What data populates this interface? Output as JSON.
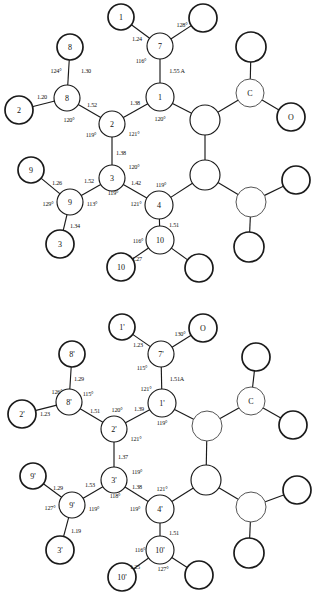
{
  "figure": {
    "title": "",
    "type": "chemical-structure-diagram",
    "panels": [
      {
        "id": "top",
        "name": "molecule-a",
        "atoms": [
          {
            "id": "n1",
            "label": "1",
            "cx": 160,
            "cy": 97,
            "r": 14,
            "style": "plain"
          },
          {
            "id": "n2",
            "label": "2",
            "cx": 112,
            "cy": 124,
            "r": 13,
            "style": "plain"
          },
          {
            "id": "n3",
            "label": "3",
            "cx": 112,
            "cy": 178,
            "r": 13,
            "style": "plain"
          },
          {
            "id": "n4",
            "label": "4",
            "cx": 159,
            "cy": 205,
            "r": 14,
            "style": "plain"
          },
          {
            "id": "n7",
            "label": "7",
            "cx": 160,
            "cy": 46,
            "r": 13,
            "style": "plain"
          },
          {
            "id": "n8",
            "label": "8",
            "cx": 67,
            "cy": 98,
            "r": 13,
            "style": "plain"
          },
          {
            "id": "n9",
            "label": "9",
            "cx": 70,
            "cy": 202,
            "r": 13,
            "style": "plain"
          },
          {
            "id": "n10",
            "label": "10",
            "cx": 160,
            "cy": 240,
            "r": 14,
            "style": "plain"
          },
          {
            "id": "t1",
            "label": "1",
            "cx": 121,
            "cy": 17,
            "r": 13,
            "style": "thick"
          },
          {
            "id": "t7b",
            "label": "",
            "cx": 203,
            "cy": 18,
            "r": 14,
            "style": "thick"
          },
          {
            "id": "t8",
            "label": "8",
            "cx": 70,
            "cy": 47,
            "r": 13,
            "style": "thick"
          },
          {
            "id": "t2",
            "label": "2",
            "cx": 19,
            "cy": 110,
            "r": 14,
            "style": "thick"
          },
          {
            "id": "t9",
            "label": "9",
            "cx": 31,
            "cy": 170,
            "r": 13,
            "style": "thick"
          },
          {
            "id": "t3",
            "label": "3",
            "cx": 60,
            "cy": 244,
            "r": 14,
            "style": "thick"
          },
          {
            "id": "t10",
            "label": "10",
            "cx": 121,
            "cy": 267,
            "r": 14,
            "style": "thick"
          },
          {
            "id": "t10b",
            "label": "",
            "cx": 199,
            "cy": 268,
            "r": 14,
            "style": "thick"
          },
          {
            "id": "r1",
            "label": "",
            "cx": 205,
            "cy": 120,
            "r": 15,
            "style": "plain"
          },
          {
            "id": "r2",
            "label": "",
            "cx": 205,
            "cy": 175,
            "r": 15,
            "style": "plain"
          },
          {
            "id": "rC",
            "label": "C",
            "cx": 250,
            "cy": 93,
            "r": 14,
            "style": "faint"
          },
          {
            "id": "rO",
            "label": "O",
            "cx": 291,
            "cy": 117,
            "r": 14,
            "style": "thick"
          },
          {
            "id": "rCtop",
            "label": "",
            "cx": 251,
            "cy": 47,
            "r": 15,
            "style": "thick"
          },
          {
            "id": "r3",
            "label": "",
            "cx": 251,
            "cy": 202,
            "r": 15,
            "style": "faint"
          },
          {
            "id": "r3a",
            "label": "",
            "cx": 296,
            "cy": 180,
            "r": 14,
            "style": "thick"
          },
          {
            "id": "r3b",
            "label": "",
            "cx": 249,
            "cy": 247,
            "r": 15,
            "style": "thick"
          }
        ],
        "bonds": [
          {
            "from": "t1",
            "to": "n7"
          },
          {
            "from": "t7b",
            "to": "n7"
          },
          {
            "from": "n7",
            "to": "n1"
          },
          {
            "from": "n1",
            "to": "n2"
          },
          {
            "from": "n1",
            "to": "r1"
          },
          {
            "from": "n2",
            "to": "n8"
          },
          {
            "from": "n2",
            "to": "n3"
          },
          {
            "from": "n8",
            "to": "t8"
          },
          {
            "from": "n8",
            "to": "t2"
          },
          {
            "from": "n3",
            "to": "n9"
          },
          {
            "from": "n3",
            "to": "n4"
          },
          {
            "from": "n9",
            "to": "t9"
          },
          {
            "from": "n9",
            "to": "t3"
          },
          {
            "from": "n4",
            "to": "n10"
          },
          {
            "from": "n4",
            "to": "r2"
          },
          {
            "from": "n10",
            "to": "t10"
          },
          {
            "from": "n10",
            "to": "t10b"
          },
          {
            "from": "r1",
            "to": "r2"
          },
          {
            "from": "r1",
            "to": "rC"
          },
          {
            "from": "rC",
            "to": "rCtop"
          },
          {
            "from": "rC",
            "to": "rO"
          },
          {
            "from": "r2",
            "to": "r3"
          },
          {
            "from": "r3",
            "to": "r3a"
          },
          {
            "from": "r3",
            "to": "r3b"
          }
        ],
        "annotations": [
          {
            "text": "128°",
            "x": 182,
            "y": 24,
            "kind": "angle"
          },
          {
            "text": "1.24",
            "x": 137,
            "y": 38,
            "kind": "length"
          },
          {
            "text": "116°",
            "x": 141,
            "y": 60,
            "kind": "angle"
          },
          {
            "text": "1.55 A",
            "x": 177,
            "y": 70,
            "kind": "length"
          },
          {
            "text": "1.30",
            "x": 86,
            "y": 70,
            "kind": "length"
          },
          {
            "text": "124°",
            "x": 56,
            "y": 70,
            "kind": "angle"
          },
          {
            "text": "1.20",
            "x": 42,
            "y": 96,
            "kind": "length"
          },
          {
            "text": "120°",
            "x": 69,
            "y": 119,
            "kind": "angle"
          },
          {
            "text": "1.52",
            "x": 92,
            "y": 104,
            "kind": "length"
          },
          {
            "text": "1.38",
            "x": 135,
            "y": 102,
            "kind": "length"
          },
          {
            "text": "120°",
            "x": 160,
            "y": 118,
            "kind": "angle"
          },
          {
            "text": "119°",
            "x": 91,
            "y": 134,
            "kind": "angle"
          },
          {
            "text": "121°",
            "x": 134,
            "y": 133,
            "kind": "angle"
          },
          {
            "text": "1.38",
            "x": 121,
            "y": 152,
            "kind": "length"
          },
          {
            "text": "120°",
            "x": 134,
            "y": 166,
            "kind": "angle"
          },
          {
            "text": "1.26",
            "x": 57,
            "y": 182,
            "kind": "length"
          },
          {
            "text": "1.52",
            "x": 89,
            "y": 180,
            "kind": "length"
          },
          {
            "text": "129°",
            "x": 48,
            "y": 203,
            "kind": "angle"
          },
          {
            "text": "113°",
            "x": 92,
            "y": 203,
            "kind": "angle"
          },
          {
            "text": "119°",
            "x": 113,
            "y": 192,
            "kind": "angle"
          },
          {
            "text": "1.42",
            "x": 136,
            "y": 182,
            "kind": "length"
          },
          {
            "text": "119°",
            "x": 161,
            "y": 184,
            "kind": "angle"
          },
          {
            "text": "121°",
            "x": 136,
            "y": 203,
            "kind": "angle"
          },
          {
            "text": "1.34",
            "x": 75,
            "y": 225,
            "kind": "length"
          },
          {
            "text": "1.51",
            "x": 174,
            "y": 224,
            "kind": "length"
          },
          {
            "text": "116°",
            "x": 138,
            "y": 240,
            "kind": "angle"
          },
          {
            "text": "1.27",
            "x": 137,
            "y": 258,
            "kind": "length"
          }
        ]
      },
      {
        "id": "bottom",
        "name": "molecule-b",
        "atoms": [
          {
            "id": "n1",
            "label": "1'",
            "cx": 162,
            "cy": 105,
            "r": 14,
            "style": "plain"
          },
          {
            "id": "n2",
            "label": "2'",
            "cx": 114,
            "cy": 131,
            "r": 13,
            "style": "plain"
          },
          {
            "id": "n3",
            "label": "3'",
            "cx": 114,
            "cy": 182,
            "r": 13,
            "style": "plain"
          },
          {
            "id": "n4",
            "label": "4'",
            "cx": 160,
            "cy": 211,
            "r": 14,
            "style": "plain"
          },
          {
            "id": "n7",
            "label": "7'",
            "cx": 161,
            "cy": 56,
            "r": 13,
            "style": "plain"
          },
          {
            "id": "n8",
            "label": "8'",
            "cx": 69,
            "cy": 104,
            "r": 13,
            "style": "plain"
          },
          {
            "id": "n9",
            "label": "9'",
            "cx": 72,
            "cy": 207,
            "r": 13,
            "style": "plain"
          },
          {
            "id": "n10",
            "label": "10'",
            "cx": 160,
            "cy": 252,
            "r": 14,
            "style": "plain"
          },
          {
            "id": "t1",
            "label": "1'",
            "cx": 122,
            "cy": 29,
            "r": 13,
            "style": "thick"
          },
          {
            "id": "tO",
            "label": "O",
            "cx": 203,
            "cy": 30,
            "r": 14,
            "style": "thick"
          },
          {
            "id": "t8",
            "label": "8'",
            "cx": 72,
            "cy": 56,
            "r": 13,
            "style": "thick"
          },
          {
            "id": "t2",
            "label": "2'",
            "cx": 22,
            "cy": 116,
            "r": 14,
            "style": "thick"
          },
          {
            "id": "t9",
            "label": "9'",
            "cx": 33,
            "cy": 178,
            "r": 13,
            "style": "thick"
          },
          {
            "id": "t3",
            "label": "3'",
            "cx": 60,
            "cy": 252,
            "r": 14,
            "style": "thick"
          },
          {
            "id": "t10",
            "label": "10'",
            "cx": 122,
            "cy": 279,
            "r": 14,
            "style": "thick"
          },
          {
            "id": "t10b",
            "label": "",
            "cx": 199,
            "cy": 277,
            "r": 14,
            "style": "thick"
          },
          {
            "id": "r1",
            "label": "",
            "cx": 207,
            "cy": 128,
            "r": 15,
            "style": "faint"
          },
          {
            "id": "r2",
            "label": "",
            "cx": 206,
            "cy": 182,
            "r": 15,
            "style": "plain"
          },
          {
            "id": "rC",
            "label": "C",
            "cx": 251,
            "cy": 103,
            "r": 14,
            "style": "faint"
          },
          {
            "id": "rCtop",
            "label": "",
            "cx": 256,
            "cy": 59,
            "r": 14,
            "style": "thick"
          },
          {
            "id": "rCright",
            "label": "",
            "cx": 293,
            "cy": 127,
            "r": 14,
            "style": "thick"
          },
          {
            "id": "r3",
            "label": "",
            "cx": 251,
            "cy": 209,
            "r": 15,
            "style": "faint"
          },
          {
            "id": "r3a",
            "label": "",
            "cx": 297,
            "cy": 192,
            "r": 14,
            "style": "thick"
          },
          {
            "id": "r3b",
            "label": "",
            "cx": 249,
            "cy": 255,
            "r": 15,
            "style": "thick"
          }
        ],
        "bonds": [
          {
            "from": "t1",
            "to": "n7"
          },
          {
            "from": "tO",
            "to": "n7"
          },
          {
            "from": "n7",
            "to": "n1"
          },
          {
            "from": "n1",
            "to": "n2"
          },
          {
            "from": "n1",
            "to": "r1"
          },
          {
            "from": "n2",
            "to": "n8"
          },
          {
            "from": "n2",
            "to": "n3"
          },
          {
            "from": "n8",
            "to": "t8"
          },
          {
            "from": "n8",
            "to": "t2"
          },
          {
            "from": "n3",
            "to": "n9"
          },
          {
            "from": "n3",
            "to": "n4"
          },
          {
            "from": "n9",
            "to": "t9"
          },
          {
            "from": "n9",
            "to": "t3"
          },
          {
            "from": "n4",
            "to": "n10"
          },
          {
            "from": "n4",
            "to": "r2"
          },
          {
            "from": "n10",
            "to": "t10"
          },
          {
            "from": "n10",
            "to": "t10b"
          },
          {
            "from": "r1",
            "to": "r2"
          },
          {
            "from": "r1",
            "to": "rC"
          },
          {
            "from": "rC",
            "to": "rCtop"
          },
          {
            "from": "rC",
            "to": "rCright"
          },
          {
            "from": "r2",
            "to": "r3"
          },
          {
            "from": "r3",
            "to": "r3a"
          },
          {
            "from": "r3",
            "to": "r3b"
          }
        ],
        "annotations": [
          {
            "text": "130°",
            "x": 180,
            "y": 35,
            "kind": "angle"
          },
          {
            "text": "1.23",
            "x": 138,
            "y": 46,
            "kind": "length"
          },
          {
            "text": "115°",
            "x": 142,
            "y": 69,
            "kind": "angle"
          },
          {
            "text": "1.51A",
            "x": 177,
            "y": 80,
            "kind": "length"
          },
          {
            "text": "1.29",
            "x": 79,
            "y": 80,
            "kind": "length"
          },
          {
            "text": "126°",
            "x": 57,
            "y": 93,
            "kind": "angle"
          },
          {
            "text": "115°",
            "x": 88,
            "y": 95,
            "kind": "angle"
          },
          {
            "text": "1.23",
            "x": 45,
            "y": 115,
            "kind": "length"
          },
          {
            "text": "1.51",
            "x": 95,
            "y": 112,
            "kind": "length"
          },
          {
            "text": "120°",
            "x": 117,
            "y": 111,
            "kind": "angle"
          },
          {
            "text": "1.39",
            "x": 139,
            "y": 110,
            "kind": "length"
          },
          {
            "text": "121°",
            "x": 146,
            "y": 90,
            "kind": "angle"
          },
          {
            "text": "119°",
            "x": 162,
            "y": 124,
            "kind": "angle"
          },
          {
            "text": "121°",
            "x": 136,
            "y": 140,
            "kind": "angle"
          },
          {
            "text": "1.37",
            "x": 123,
            "y": 158,
            "kind": "length"
          },
          {
            "text": "119°",
            "x": 137,
            "y": 173,
            "kind": "angle"
          },
          {
            "text": "1.29",
            "x": 58,
            "y": 189,
            "kind": "length"
          },
          {
            "text": "1.53",
            "x": 90,
            "y": 186,
            "kind": "length"
          },
          {
            "text": "118°",
            "x": 115,
            "y": 197,
            "kind": "angle"
          },
          {
            "text": "127°",
            "x": 50,
            "y": 209,
            "kind": "angle"
          },
          {
            "text": "119°",
            "x": 94,
            "y": 210,
            "kind": "angle"
          },
          {
            "text": "1.38",
            "x": 137,
            "y": 188,
            "kind": "length"
          },
          {
            "text": "121°",
            "x": 162,
            "y": 190,
            "kind": "angle"
          },
          {
            "text": "119°",
            "x": 135,
            "y": 210,
            "kind": "angle"
          },
          {
            "text": "1.19",
            "x": 76,
            "y": 232,
            "kind": "length"
          },
          {
            "text": "1.51",
            "x": 174,
            "y": 234,
            "kind": "length"
          },
          {
            "text": "116°",
            "x": 140,
            "y": 251,
            "kind": "angle"
          },
          {
            "text": "1.25",
            "x": 135,
            "y": 268,
            "kind": "length"
          },
          {
            "text": "127°",
            "x": 163,
            "y": 270,
            "kind": "angle"
          }
        ]
      }
    ]
  }
}
